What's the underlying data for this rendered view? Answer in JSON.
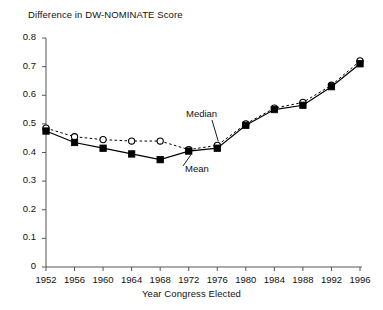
{
  "chart_data": {
    "type": "line",
    "title": "",
    "ylabel": "Difference in DW-NOMINATE Score",
    "xlabel": "Year Congress Elected",
    "x": [
      1952,
      1956,
      1960,
      1964,
      1968,
      1972,
      1976,
      1980,
      1984,
      1988,
      1992,
      1996
    ],
    "categories": [
      "1952",
      "1956",
      "1960",
      "1964",
      "1968",
      "1972",
      "1976",
      "1980",
      "1984",
      "1988",
      "1992",
      "1996"
    ],
    "xlim": [
      1950,
      1998
    ],
    "ylim": [
      0,
      0.8
    ],
    "ytick_labels": [
      "0",
      "0.1",
      "0.2",
      "0.3",
      "0.4",
      "0.5",
      "0.6",
      "0.7",
      "0.8"
    ],
    "ytick_values": [
      0,
      0.1,
      0.2,
      0.3,
      0.4,
      0.5,
      0.6,
      0.7,
      0.8
    ],
    "grid": false,
    "legend_position": "inline-annotations",
    "series": [
      {
        "name": "Median",
        "marker": "open-circle",
        "line_style": "dashed",
        "color": "#000000",
        "values": [
          0.485,
          0.455,
          0.445,
          0.44,
          0.44,
          0.41,
          0.425,
          0.5,
          0.555,
          0.575,
          0.635,
          0.72
        ]
      },
      {
        "name": "Mean",
        "marker": "filled-square",
        "line_style": "solid",
        "color": "#000000",
        "values": [
          0.475,
          0.435,
          0.415,
          0.395,
          0.375,
          0.405,
          0.415,
          0.495,
          0.55,
          0.565,
          0.63,
          0.71
        ]
      }
    ],
    "annotations": [
      {
        "text": "Median",
        "target_series": "Median",
        "target_x": 1976
      },
      {
        "text": "Mean",
        "target_series": "Mean",
        "target_x": 1972
      }
    ]
  },
  "axis": {
    "y_title": "Difference in DW-NOMINATE Score",
    "x_title": "Year Congress Elected"
  }
}
